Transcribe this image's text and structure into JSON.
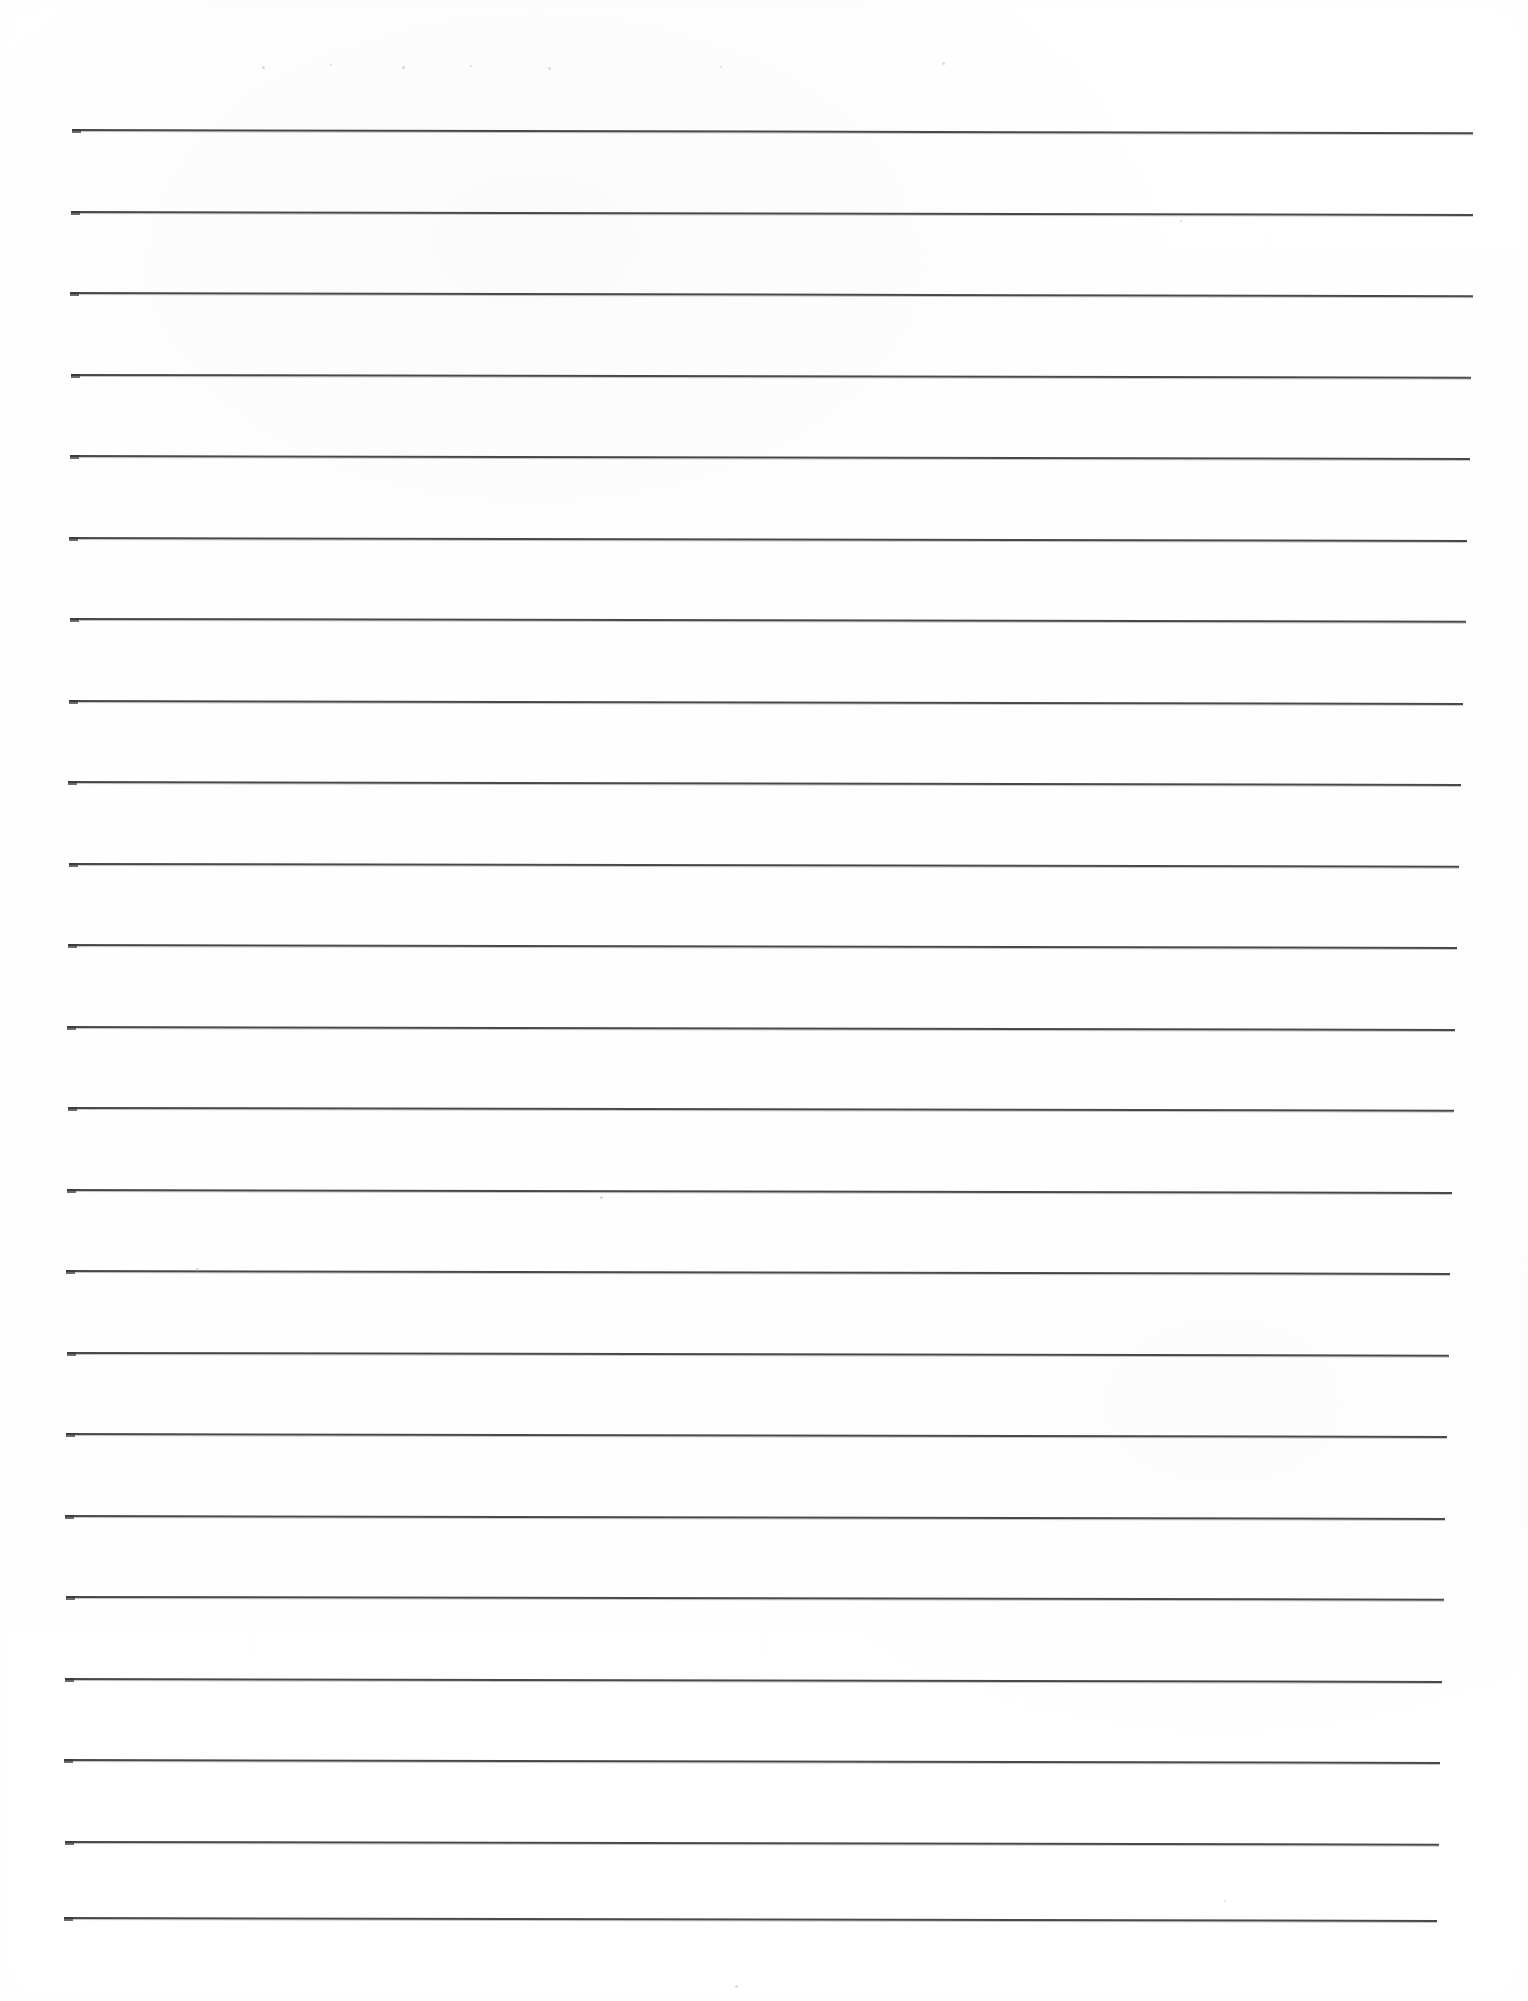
{
  "document": {
    "kind": "scanned-lined-paper",
    "title": "Blank lined notepaper scan",
    "page_width": 1528,
    "page_height": 2001,
    "background_color": "#ffffff",
    "rule_color": "#3a3a3c",
    "has_visible_text": false,
    "text_content": ""
  },
  "ruling": {
    "line_count": 23,
    "line_thickness_px": 2,
    "spacing_px": 81.3,
    "first_line_y_px": 129,
    "last_line_y_px": 1917,
    "left_margin_x_px": 70,
    "right_margin_x_px": 1473,
    "line_length_px": 1403,
    "skew_degrees": 0.12,
    "lines": [
      {
        "index": 1,
        "x": 72,
        "y": 129,
        "width": 1401,
        "rotate": 0.13,
        "blob": true
      },
      {
        "index": 2,
        "x": 71,
        "y": 211,
        "width": 1402,
        "rotate": 0.12,
        "blob": true
      },
      {
        "index": 3,
        "x": 70,
        "y": 292,
        "width": 1403,
        "rotate": 0.13,
        "blob": true
      },
      {
        "index": 4,
        "x": 71,
        "y": 374,
        "width": 1400,
        "rotate": 0.11,
        "blob": true
      },
      {
        "index": 5,
        "x": 70,
        "y": 455,
        "width": 1400,
        "rotate": 0.12,
        "blob": true
      },
      {
        "index": 6,
        "x": 69,
        "y": 537,
        "width": 1398,
        "rotate": 0.12,
        "blob": true
      },
      {
        "index": 7,
        "x": 70,
        "y": 618,
        "width": 1396,
        "rotate": 0.11,
        "blob": true
      },
      {
        "index": 8,
        "x": 69,
        "y": 700,
        "width": 1394,
        "rotate": 0.12,
        "blob": true
      },
      {
        "index": 9,
        "x": 68,
        "y": 781,
        "width": 1393,
        "rotate": 0.12,
        "blob": true
      },
      {
        "index": 10,
        "x": 69,
        "y": 863,
        "width": 1390,
        "rotate": 0.11,
        "blob": true
      },
      {
        "index": 11,
        "x": 68,
        "y": 944,
        "width": 1389,
        "rotate": 0.12,
        "blob": true
      },
      {
        "index": 12,
        "x": 67,
        "y": 1026,
        "width": 1388,
        "rotate": 0.12,
        "blob": true
      },
      {
        "index": 13,
        "x": 68,
        "y": 1107,
        "width": 1386,
        "rotate": 0.11,
        "blob": true
      },
      {
        "index": 14,
        "x": 67,
        "y": 1189,
        "width": 1385,
        "rotate": 0.12,
        "blob": true
      },
      {
        "index": 15,
        "x": 66,
        "y": 1270,
        "width": 1384,
        "rotate": 0.12,
        "blob": true
      },
      {
        "index": 16,
        "x": 67,
        "y": 1352,
        "width": 1382,
        "rotate": 0.11,
        "blob": true
      },
      {
        "index": 17,
        "x": 66,
        "y": 1433,
        "width": 1381,
        "rotate": 0.12,
        "blob": true
      },
      {
        "index": 18,
        "x": 65,
        "y": 1515,
        "width": 1380,
        "rotate": 0.12,
        "blob": true
      },
      {
        "index": 19,
        "x": 66,
        "y": 1596,
        "width": 1378,
        "rotate": 0.11,
        "blob": true
      },
      {
        "index": 20,
        "x": 65,
        "y": 1678,
        "width": 1377,
        "rotate": 0.12,
        "blob": true
      },
      {
        "index": 21,
        "x": 64,
        "y": 1759,
        "width": 1376,
        "rotate": 0.12,
        "blob": true
      },
      {
        "index": 22,
        "x": 65,
        "y": 1841,
        "width": 1374,
        "rotate": 0.11,
        "blob": true
      },
      {
        "index": 23,
        "x": 64,
        "y": 1917,
        "width": 1373,
        "rotate": 0.12,
        "blob": true
      }
    ]
  },
  "artifacts": {
    "specks": [
      {
        "x": 262,
        "y": 66,
        "size": 3
      },
      {
        "x": 330,
        "y": 64,
        "size": 2
      },
      {
        "x": 402,
        "y": 66,
        "size": 3
      },
      {
        "x": 470,
        "y": 65,
        "size": 2
      },
      {
        "x": 548,
        "y": 67,
        "size": 3
      },
      {
        "x": 720,
        "y": 66,
        "size": 2
      },
      {
        "x": 942,
        "y": 62,
        "size": 3
      },
      {
        "x": 1180,
        "y": 220,
        "size": 2
      },
      {
        "x": 600,
        "y": 1196,
        "size": 3
      },
      {
        "x": 196,
        "y": 1268,
        "size": 3
      },
      {
        "x": 1224,
        "y": 1900,
        "size": 2
      },
      {
        "x": 735,
        "y": 1985,
        "size": 3
      }
    ]
  }
}
